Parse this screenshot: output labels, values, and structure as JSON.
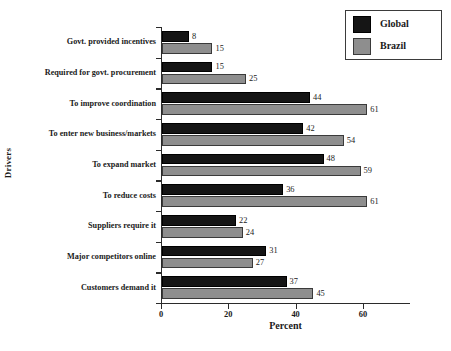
{
  "chart_data": {
    "type": "bar",
    "orientation": "horizontal",
    "title": "",
    "xlabel": "Percent",
    "ylabel": "Drivers",
    "xlim": [
      0,
      74
    ],
    "xticks": [
      0,
      20,
      40,
      60
    ],
    "xtick_labels": [
      "0",
      "20",
      "40",
      "60"
    ],
    "grid": false,
    "legend_position": "top-right",
    "categories": [
      "Govt. provided incentives",
      "Required for govt. procurement",
      "To improve coordination",
      "To enter new business/markets",
      "To expand market",
      "To reduce costs",
      "Suppliers require it",
      "Major competitors online",
      "Customers demand it"
    ],
    "series": [
      {
        "name": "Global",
        "color": "#151515",
        "values": [
          8,
          15,
          44,
          42,
          48,
          36,
          22,
          31,
          37
        ],
        "value_labels": [
          "8",
          "15",
          "44",
          "42",
          "48",
          "36",
          "22",
          "31",
          "37"
        ]
      },
      {
        "name": "Brazil",
        "color": "#8e8e8e",
        "values": [
          15,
          25,
          61,
          54,
          59,
          61,
          24,
          27,
          45
        ],
        "value_labels": [
          "15",
          "25",
          "61",
          "54",
          "59",
          "61",
          "24",
          "27",
          "45"
        ]
      }
    ]
  },
  "legend": {
    "entries": [
      {
        "label": "Global",
        "swatch": "global"
      },
      {
        "label": "Brazil",
        "swatch": "brazil"
      }
    ]
  }
}
